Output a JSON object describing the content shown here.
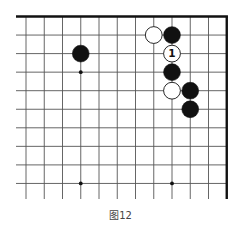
{
  "diagram": {
    "caption": "图12",
    "board": {
      "type": "go-board-fragment",
      "edges": [
        "top",
        "right"
      ],
      "columns_visible": 12,
      "rows_visible": 10,
      "grid_color": "#555555",
      "border_color": "#111111",
      "stone_black": "#111111",
      "stone_white": "#ffffff"
    },
    "star_points": [
      {
        "col": 3,
        "row": 3
      },
      {
        "col": 3,
        "row": 9
      },
      {
        "col": 8,
        "row": 9
      }
    ],
    "stones": [
      {
        "color": "black",
        "col": 3,
        "row": 2,
        "label": ""
      },
      {
        "color": "white",
        "col": 7,
        "row": 1,
        "label": ""
      },
      {
        "color": "black",
        "col": 8,
        "row": 1,
        "label": ""
      },
      {
        "color": "white",
        "col": 8,
        "row": 2,
        "label": "1"
      },
      {
        "color": "black",
        "col": 8,
        "row": 3,
        "label": ""
      },
      {
        "color": "white",
        "col": 8,
        "row": 4,
        "label": ""
      },
      {
        "color": "black",
        "col": 9,
        "row": 4,
        "label": ""
      },
      {
        "color": "black",
        "col": 9,
        "row": 5,
        "label": ""
      }
    ]
  }
}
